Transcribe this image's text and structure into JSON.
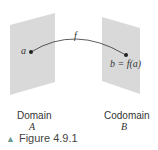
{
  "diagram": {
    "function_label": "f",
    "point_a_label": "a",
    "point_b_label": "b = f(a)",
    "domain": {
      "title": "Domain",
      "set": "A"
    },
    "codomain": {
      "title": "Codomain",
      "set": "B"
    },
    "panel_color": "#d9d9d9",
    "arrow_color": "#333333"
  },
  "caption": {
    "marker": "▲",
    "text": "Figure 4.9.1",
    "marker_color": "#6a9b94"
  }
}
